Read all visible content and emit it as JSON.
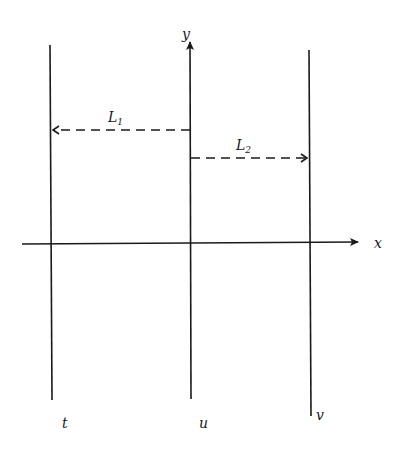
{
  "diagram": {
    "axes": {
      "x_label": "x",
      "y_label": "y"
    },
    "vertical_lines": [
      {
        "name": "t",
        "label": "t"
      },
      {
        "name": "u",
        "label": "u"
      },
      {
        "name": "v",
        "label": "v"
      }
    ],
    "distances": [
      {
        "name": "L1",
        "label_main": "L",
        "label_sub": "1",
        "from": "u",
        "to": "t",
        "style": "dashed-arrow"
      },
      {
        "name": "L2",
        "label_main": "L",
        "label_sub": "2",
        "from": "u",
        "to": "v",
        "style": "dashed-arrow"
      }
    ],
    "colors": {
      "line": "#1a1a1a",
      "background": "#ffffff"
    }
  }
}
